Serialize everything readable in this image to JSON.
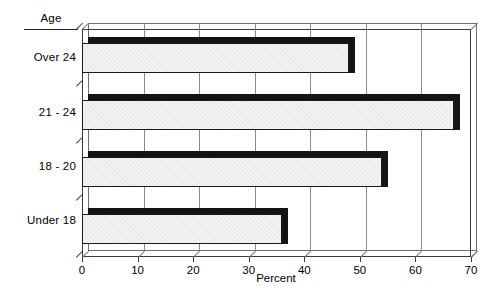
{
  "chart_data": {
    "type": "bar",
    "orientation": "horizontal",
    "title": "",
    "xlabel": "Percent",
    "ylabel": "Age",
    "categories": [
      "Over 24",
      "21 - 24",
      "18 - 20",
      "Under 18"
    ],
    "values": [
      48,
      67,
      54,
      36
    ],
    "xlim": [
      0,
      70
    ],
    "xticks": [
      0,
      10,
      20,
      30,
      40,
      50,
      60,
      70
    ],
    "xtick_labels": [
      "0",
      "10",
      "20",
      "30",
      "40",
      "50",
      "60",
      "70"
    ],
    "grid": "vertical",
    "legend": "none",
    "style": "3d-shadow-bars",
    "colors": {
      "bar_face": "#f2f2f2",
      "bar_edge": "#1a1a1a",
      "bar_shadow": "#141414",
      "gridline": "#8a8a8a",
      "axis": "#3a3a3a",
      "background": "#ffffff",
      "text": "#000000"
    }
  }
}
